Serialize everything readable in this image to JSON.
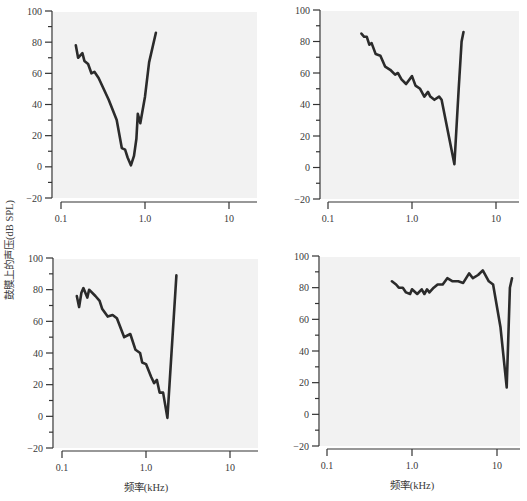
{
  "figure": {
    "shared_ylabel": "鼓膜上的声压(dB SPL)",
    "shared_xlabel": "频率(kHz)"
  },
  "chart_data": [
    {
      "type": "line",
      "panel": "top-left",
      "title": "",
      "xlabel": "",
      "ylabel": "鼓膜上的声压(dB SPL)",
      "xscale": "log",
      "xlim": [
        0.1,
        20
      ],
      "ylim": [
        -20,
        100
      ],
      "xticks": [
        0.1,
        1.0,
        10
      ],
      "xtick_labels": [
        "0.1",
        "1.0",
        "10"
      ],
      "yticks": [
        -20,
        0,
        20,
        40,
        60,
        80,
        100
      ],
      "ytick_labels": [
        "−20",
        "0",
        "20",
        "40",
        "60",
        "80",
        "100"
      ],
      "grid": false,
      "series": [
        {
          "name": "curve",
          "x": [
            0.15,
            0.16,
            0.18,
            0.19,
            0.21,
            0.23,
            0.25,
            0.28,
            0.37,
            0.46,
            0.53,
            0.58,
            0.62,
            0.68,
            0.74,
            0.79,
            0.82,
            0.88,
            1.0,
            1.12,
            1.35
          ],
          "y": [
            78,
            70,
            73,
            68,
            66,
            60,
            61,
            57,
            43,
            30,
            12,
            11,
            6,
            1,
            7,
            18,
            34,
            28,
            45,
            67,
            86
          ]
        }
      ]
    },
    {
      "type": "line",
      "panel": "top-right",
      "title": "",
      "xlabel": "",
      "ylabel": "",
      "xscale": "log",
      "xlim": [
        0.1,
        20
      ],
      "ylim": [
        -20,
        100
      ],
      "xticks": [
        0.1,
        1.0,
        10
      ],
      "xtick_labels": [
        "0.1",
        "1.0",
        "10"
      ],
      "yticks": [
        -20,
        0,
        20,
        40,
        60,
        80,
        100
      ],
      "ytick_labels": [
        "−20",
        "0",
        "20",
        "40",
        "60",
        "80",
        "100"
      ],
      "grid": false,
      "series": [
        {
          "name": "curve",
          "x": [
            0.25,
            0.27,
            0.29,
            0.31,
            0.33,
            0.37,
            0.42,
            0.48,
            0.55,
            0.63,
            0.68,
            0.75,
            0.85,
            1.0,
            1.1,
            1.25,
            1.4,
            1.55,
            1.65,
            1.85,
            2.1,
            2.25,
            3.2,
            3.6,
            3.9,
            4.1
          ],
          "y": [
            85,
            83,
            83,
            78,
            79,
            72,
            71,
            64,
            62,
            59,
            60,
            56,
            53,
            58,
            52,
            50,
            45,
            48,
            45,
            43,
            45,
            43,
            2,
            50,
            80,
            86
          ]
        }
      ]
    },
    {
      "type": "line",
      "panel": "bottom-left",
      "title": "",
      "xlabel": "频率(kHz)",
      "ylabel": "",
      "xscale": "log",
      "xlim": [
        0.1,
        20
      ],
      "ylim": [
        -20,
        100
      ],
      "xticks": [
        0.1,
        1.0,
        10
      ],
      "xtick_labels": [
        "0.1",
        "1.0",
        "10"
      ],
      "yticks": [
        -20,
        0,
        20,
        40,
        60,
        80,
        100
      ],
      "ytick_labels": [
        "−20",
        "0",
        "20",
        "40",
        "60",
        "80",
        "100"
      ],
      "grid": false,
      "series": [
        {
          "name": "curve",
          "x": [
            0.15,
            0.16,
            0.17,
            0.18,
            0.2,
            0.21,
            0.25,
            0.28,
            0.3,
            0.35,
            0.4,
            0.45,
            0.55,
            0.65,
            0.75,
            0.85,
            0.9,
            1.0,
            1.15,
            1.25,
            1.35,
            1.45,
            1.6,
            1.8,
            2.3
          ],
          "y": [
            76,
            69,
            78,
            81,
            75,
            80,
            76,
            73,
            68,
            63,
            64,
            62,
            50,
            52,
            42,
            40,
            34,
            33,
            25,
            21,
            23,
            15,
            15,
            -1,
            89
          ]
        }
      ]
    },
    {
      "type": "line",
      "panel": "bottom-right",
      "title": "",
      "xlabel": "频率(kHz)",
      "ylabel": "",
      "xscale": "log",
      "xlim": [
        0.1,
        20
      ],
      "ylim": [
        -20,
        100
      ],
      "xticks": [
        0.1,
        1.0,
        10
      ],
      "xtick_labels": [
        "0.1",
        "1.0",
        "10"
      ],
      "yticks": [
        -20,
        0,
        20,
        40,
        60,
        80,
        100
      ],
      "ytick_labels": [
        "−20",
        "0",
        "20",
        "40",
        "60",
        "80",
        "100"
      ],
      "grid": false,
      "series": [
        {
          "name": "curve",
          "x": [
            0.58,
            0.65,
            0.7,
            0.78,
            0.85,
            0.95,
            1.0,
            1.15,
            1.3,
            1.4,
            1.5,
            1.6,
            1.8,
            2.0,
            2.3,
            2.6,
            3.0,
            3.5,
            4.0,
            4.7,
            5.2,
            6.0,
            6.8,
            8.0,
            9.0,
            11.0,
            13.0,
            14.2,
            15.0
          ],
          "y": [
            84,
            82,
            80,
            80,
            77,
            76,
            79,
            76,
            79,
            76,
            79,
            77,
            80,
            82,
            82,
            86,
            84,
            84,
            83,
            89,
            86,
            88,
            91,
            84,
            82,
            55,
            17,
            80,
            86
          ]
        }
      ]
    }
  ]
}
